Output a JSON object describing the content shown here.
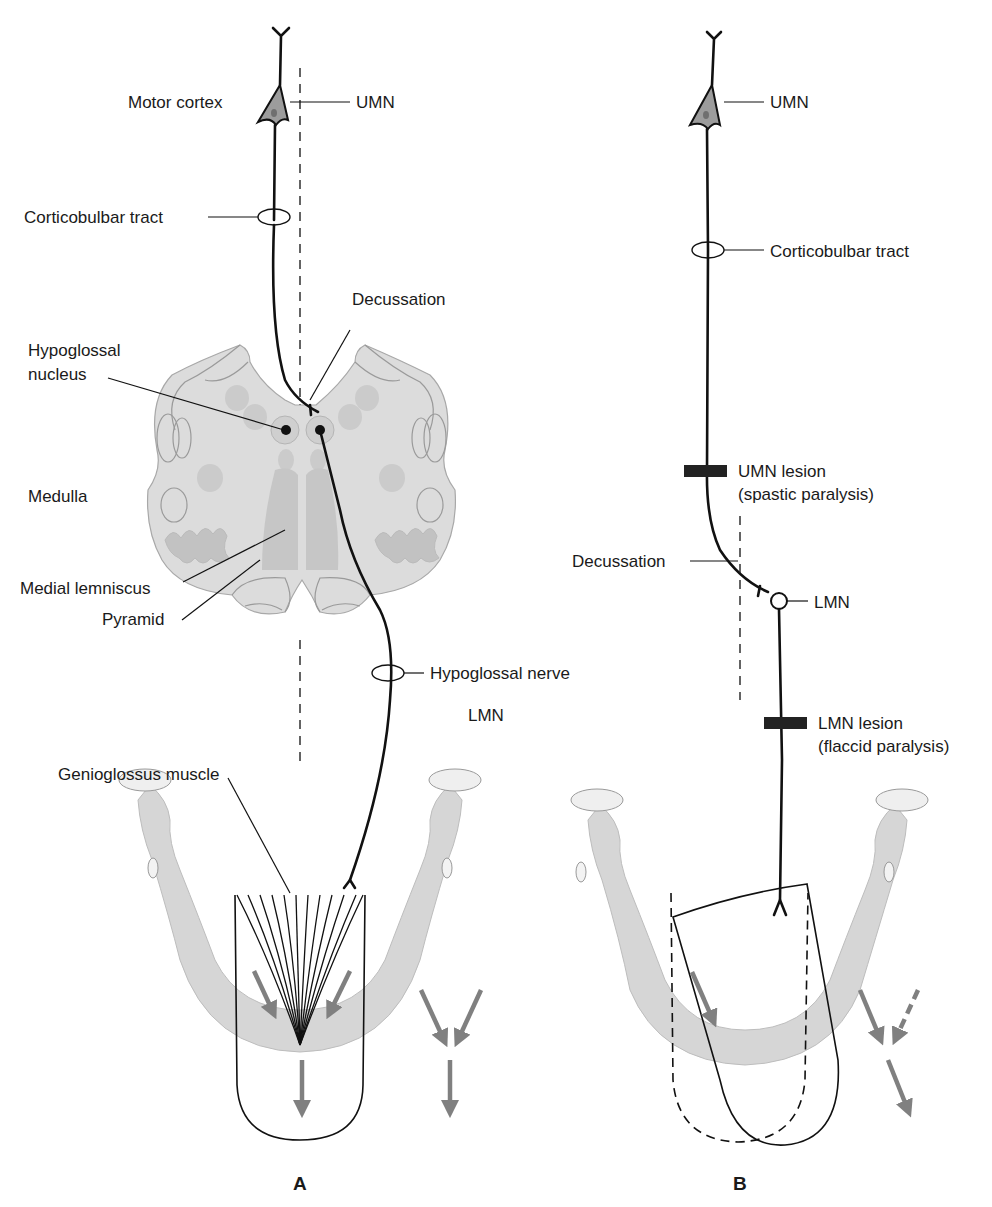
{
  "panels": {
    "A": {
      "label": "A",
      "labels": {
        "motor_cortex": "Motor cortex",
        "umn": "UMN",
        "corticobulbar_tract": "Corticobulbar tract",
        "decussation": "Decussation",
        "hypoglossal_nucleus_line1": "Hypoglossal",
        "hypoglossal_nucleus_line2": "nucleus",
        "medulla": "Medulla",
        "medial_lemniscus": "Medial lemniscus",
        "pyramid": "Pyramid",
        "hypoglossal_nerve": "Hypoglossal nerve",
        "lmn": "LMN",
        "genioglossus_muscle": "Genioglossus muscle"
      }
    },
    "B": {
      "label": "B",
      "labels": {
        "umn": "UMN",
        "corticobulbar_tract": "Corticobulbar tract",
        "umn_lesion_line1": "UMN lesion",
        "umn_lesion_line2": "(spastic paralysis)",
        "decussation": "Decussation",
        "lmn": "LMN",
        "lmn_lesion_line1": "LMN lesion",
        "lmn_lesion_line2": "(flaccid paralysis)"
      }
    }
  },
  "colors": {
    "line": "#111111",
    "arrow_gray": "#808080",
    "tissue_gray": "#d6d6d6",
    "background": "#ffffff"
  }
}
